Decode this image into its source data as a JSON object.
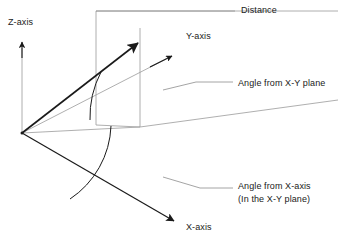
{
  "figure": {
    "kind": "spherical-coordinate-diagram",
    "background_color": "#ffffff",
    "stroke_dark": "#1a1a1a",
    "stroke_light": "#9a9a9a",
    "labels": {
      "z_axis": "Z-axis",
      "y_axis": "Y-axis",
      "x_axis": "X-axis",
      "distance": "Distance",
      "angle_from_xy_plane": "Angle from X-Y plane",
      "angle_from_x_axis": "Angle from X-axis",
      "angle_from_x_axis_note": "(In the X-Y plane)"
    },
    "elements": {
      "origin": "origin-point",
      "z_axis_arrow": "z-axis-arrow",
      "y_axis_arrow": "y-axis-arrow",
      "x_axis_arrow": "x-axis-arrow",
      "distance_vector_arrow": "distance-vector-arrow",
      "elevation_arc": "elevation-angle-arc",
      "azimuth_arc": "azimuth-angle-arc",
      "projection_plane": "vertical-projection-plane",
      "leader_distance": "leader-line-distance",
      "leader_angle_xy": "leader-line-angle-xy-plane",
      "leader_angle_x": "leader-line-angle-x-axis"
    }
  }
}
